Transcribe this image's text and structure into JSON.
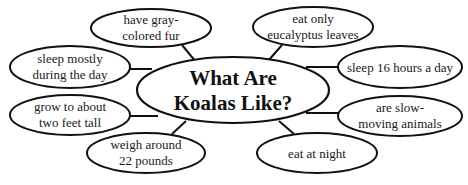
{
  "diagram": {
    "type": "concept-web",
    "center": {
      "lines": [
        "What Are",
        "Koalas Like?"
      ]
    },
    "nodes": [
      {
        "id": "gray-fur",
        "lines": [
          "have gray-",
          "colored fur"
        ]
      },
      {
        "id": "eucalyptus",
        "lines": [
          "eat only",
          "eucalyptus leaves"
        ]
      },
      {
        "id": "sleep-day",
        "lines": [
          "sleep mostly",
          "during the day"
        ]
      },
      {
        "id": "sleep-16",
        "lines": [
          "sleep 16 hours a day"
        ]
      },
      {
        "id": "two-feet",
        "lines": [
          "grow to about",
          "two feet tall"
        ]
      },
      {
        "id": "slow-moving",
        "lines": [
          "are slow-",
          "moving animals"
        ]
      },
      {
        "id": "weigh",
        "lines": [
          "weigh around",
          "22 pounds"
        ]
      },
      {
        "id": "night",
        "lines": [
          "eat at night"
        ]
      }
    ]
  }
}
